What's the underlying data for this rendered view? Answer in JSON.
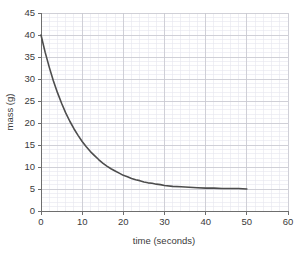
{
  "chart_data": {
    "type": "line",
    "title": "",
    "xlabel": "time (seconds)",
    "ylabel": "mass (g)",
    "xlim": [
      0,
      60
    ],
    "ylim": [
      0,
      45
    ],
    "xticks": [
      0,
      10,
      20,
      30,
      40,
      50,
      60
    ],
    "yticks": [
      0,
      5,
      10,
      15,
      20,
      25,
      30,
      35,
      40,
      45
    ],
    "xtick_labels": [
      "0",
      "10",
      "20",
      "30",
      "40",
      "50",
      "60"
    ],
    "ytick_labels": [
      "0",
      "5",
      "10",
      "15",
      "20",
      "25",
      "30",
      "35",
      "40",
      "45"
    ],
    "x_minor_step": 2,
    "y_minor_step": 1,
    "grid": true,
    "grid_major_color": "#c8c8d0",
    "grid_minor_color": "#e6e6ee",
    "legend": null,
    "series": [
      {
        "name": "mass",
        "color": "#4d4d4d",
        "asymptote": 5,
        "x": [
          0,
          1,
          2,
          3,
          4,
          5,
          6,
          7,
          8,
          9,
          10,
          11,
          12,
          13,
          14,
          15,
          16,
          17,
          18,
          19,
          20,
          21,
          22,
          23,
          24,
          25,
          26,
          27,
          28,
          29,
          30,
          32,
          34,
          36,
          38,
          40,
          42,
          44,
          46,
          48,
          50
        ],
        "y": [
          40.0,
          36.1,
          32.7,
          29.6,
          26.9,
          24.5,
          22.3,
          20.4,
          18.7,
          17.2,
          15.8,
          14.6,
          13.5,
          12.6,
          11.7,
          10.9,
          10.2,
          9.6,
          9.1,
          8.6,
          8.1,
          7.8,
          7.4,
          7.1,
          6.9,
          6.6,
          6.4,
          6.3,
          6.1,
          6.0,
          5.8,
          5.6,
          5.5,
          5.4,
          5.3,
          5.2,
          5.2,
          5.1,
          5.1,
          5.1,
          5.0
        ]
      }
    ]
  },
  "figure": {
    "background_color": "#ffffff",
    "axis_color": "#6e6e6e",
    "text_color": "#3a3a3a"
  }
}
